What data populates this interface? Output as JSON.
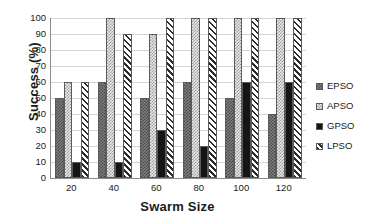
{
  "chart_data": {
    "type": "bar",
    "title": "",
    "xlabel": "Swarm Size",
    "ylabel": "Success (%)",
    "categories": [
      "20",
      "40",
      "60",
      "80",
      "100",
      "120"
    ],
    "series": [
      {
        "name": "EPSO",
        "values": [
          50,
          60,
          50,
          60,
          50,
          40
        ]
      },
      {
        "name": "APSO",
        "values": [
          60,
          100,
          90,
          100,
          100,
          100
        ]
      },
      {
        "name": "GPSO",
        "values": [
          10,
          10,
          30,
          20,
          60,
          60
        ]
      },
      {
        "name": "LPSO",
        "values": [
          60,
          90,
          100,
          100,
          100,
          100
        ]
      }
    ],
    "ylim": [
      0,
      100
    ],
    "yticks": [
      0,
      10,
      20,
      30,
      40,
      50,
      60,
      70,
      80,
      90,
      100
    ],
    "grid": "horizontal",
    "legend_position": "right",
    "colors": {
      "EPSO": "#7d7d7d",
      "APSO": "#eaeaea",
      "GPSO": "#151515",
      "LPSO": "#ffffff"
    },
    "patterns": {
      "EPSO": "checker-dark",
      "APSO": "checker-light",
      "GPSO": "solid-black",
      "LPSO": "diagonal-hatch"
    }
  },
  "legend": {
    "items": [
      {
        "label": "EPSO",
        "swatch": "checker-dark-swatch"
      },
      {
        "label": "APSO",
        "swatch": "checker-light-swatch"
      },
      {
        "label": "GPSO",
        "swatch": "solid-black-swatch"
      },
      {
        "label": "LPSO",
        "swatch": "diagonal-hatch-swatch"
      }
    ]
  }
}
